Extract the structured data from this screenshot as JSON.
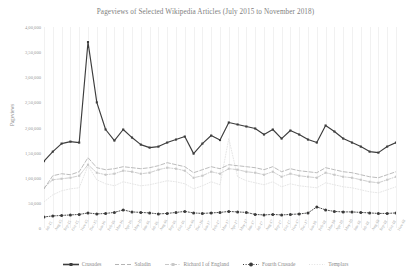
{
  "chart_data": {
    "type": "line",
    "title": "Pageviews of Selected Wikipedia Articles (July 2015 to November 2018)",
    "xlabel": "",
    "ylabel": "Pageviews",
    "ylim": [
      0,
      400000
    ],
    "grid": "vertical",
    "legend_position": "bottom",
    "ytick_labels": [
      "4,00,000",
      "3,50,000",
      "3,00,000",
      "2,50,000",
      "2,00,000",
      "1,50,000",
      "1,00,000",
      "50,000",
      "0"
    ],
    "ytick_values": [
      400000,
      350000,
      300000,
      250000,
      200000,
      150000,
      100000,
      50000,
      0
    ],
    "categories": [
      "Jul-15",
      "Aug-15",
      "Sep-15",
      "Oct-15",
      "Nov-15",
      "Dec-15",
      "Jan-16",
      "Feb-16",
      "Mar-16",
      "Apr-16",
      "May-16",
      "Jun-16",
      "Jul-16",
      "Aug-16",
      "Sep-16",
      "Oct-16",
      "Nov-16",
      "Dec-16",
      "Jan-17",
      "Feb-17",
      "Mar-17",
      "Apr-17",
      "May-17",
      "Jun-17",
      "Jul-17",
      "Aug-17",
      "Sep-17",
      "Oct-17",
      "Nov-17",
      "Dec-17",
      "Jan-18",
      "Feb-18",
      "Mar-18",
      "Apr-18",
      "May-18",
      "Jun-18",
      "Jul-18",
      "Aug-18",
      "Sep-18",
      "Oct-18",
      "Nov-18"
    ],
    "series": [
      {
        "name": "Crusades",
        "color": "#3d3d3d",
        "style": "solid",
        "marker": "square",
        "values": [
          133000,
          152000,
          168000,
          172000,
          170000,
          370000,
          250000,
          196000,
          174000,
          196000,
          180000,
          166000,
          160000,
          162000,
          170000,
          176000,
          182000,
          148000,
          168000,
          184000,
          175000,
          210000,
          206000,
          202000,
          198000,
          186000,
          196000,
          178000,
          194000,
          186000,
          176000,
          170000,
          204000,
          192000,
          178000,
          170000,
          162000,
          152000,
          150000,
          162000,
          170000
        ]
      },
      {
        "name": "Saladin",
        "color": "#b4b4b4",
        "style": "dashed",
        "marker": "none",
        "values": [
          78000,
          104000,
          108000,
          106000,
          112000,
          140000,
          120000,
          116000,
          118000,
          122000,
          120000,
          118000,
          120000,
          124000,
          130000,
          126000,
          122000,
          110000,
          116000,
          122000,
          118000,
          126000,
          124000,
          122000,
          120000,
          116000,
          122000,
          112000,
          118000,
          114000,
          112000,
          110000,
          120000,
          116000,
          112000,
          110000,
          106000,
          102000,
          100000,
          106000,
          112000
        ]
      },
      {
        "name": "Richard I of England",
        "color": "#c8c8c8",
        "style": "dash-dot",
        "marker": "square",
        "values": [
          80000,
          96000,
          98000,
          100000,
          104000,
          126000,
          110000,
          106000,
          108000,
          114000,
          112000,
          108000,
          110000,
          116000,
          120000,
          118000,
          114000,
          100000,
          104000,
          112000,
          108000,
          118000,
          116000,
          112000,
          110000,
          106000,
          112000,
          102000,
          108000,
          104000,
          102000,
          100000,
          110000,
          106000,
          102000,
          100000,
          96000,
          92000,
          90000,
          96000,
          102000
        ]
      },
      {
        "name": "Fourth Crusade",
        "color": "#3a3a3a",
        "style": "dotted",
        "marker": "circle",
        "values": [
          22000,
          24000,
          25000,
          26000,
          27000,
          30000,
          28000,
          29000,
          31000,
          36000,
          32000,
          31000,
          30000,
          28000,
          29000,
          31000,
          33000,
          30000,
          29000,
          30000,
          31000,
          33000,
          32000,
          31000,
          27000,
          26000,
          27000,
          26000,
          27000,
          28000,
          30000,
          42000,
          36000,
          33000,
          32000,
          32000,
          31000,
          30000,
          29000,
          29000,
          30000
        ]
      },
      {
        "name": "Templars",
        "color": "#e2e2e2",
        "style": "dotted",
        "marker": "none",
        "values": [
          52000,
          66000,
          74000,
          78000,
          80000,
          124000,
          96000,
          88000,
          84000,
          92000,
          88000,
          84000,
          86000,
          90000,
          94000,
          92000,
          88000,
          78000,
          84000,
          92000,
          86000,
          178000,
          102000,
          94000,
          90000,
          86000,
          92000,
          82000,
          88000,
          84000,
          82000,
          80000,
          90000,
          86000,
          82000,
          80000,
          76000,
          72000,
          70000,
          76000,
          82000
        ]
      }
    ]
  }
}
